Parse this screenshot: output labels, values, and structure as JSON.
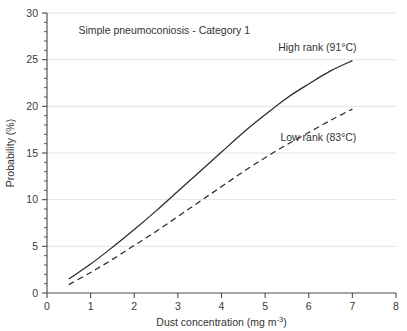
{
  "chart_data": {
    "type": "line",
    "title": "",
    "annotation_title": "Simple pneumoconiosis - Category 1",
    "xlabel_main": "Dust concentration (mg m",
    "xlabel_sup": "-3",
    "xlabel_tail": ")",
    "xlabel_full": "Dust concentration (mg m-3)",
    "ylabel": "Probability (%)",
    "xlim": [
      0,
      8
    ],
    "ylim": [
      0,
      30
    ],
    "xticks": [
      0,
      1,
      2,
      3,
      4,
      5,
      6,
      7,
      8
    ],
    "xtick_labels": [
      "0",
      "1",
      "2",
      "3",
      "4",
      "5",
      "6",
      "7",
      "8"
    ],
    "yticks": [
      0,
      5,
      10,
      15,
      20,
      25,
      30
    ],
    "ytick_labels": [
      "0",
      "5",
      "10",
      "15",
      "20",
      "25",
      "30"
    ],
    "y_minor_ticks": [
      1,
      2,
      3,
      4,
      6,
      7,
      8,
      9,
      11,
      12,
      13,
      14,
      16,
      17,
      18,
      19,
      21,
      22,
      23,
      24,
      26,
      27,
      28,
      29
    ],
    "grid": "horizontal-major",
    "grid_color": "#e3e3e3",
    "axis_color": "#4a4a4a",
    "legend_position": "inline-annotation",
    "series": [
      {
        "name": "High rank (91°C)",
        "label": "High rank (91°C)",
        "style": "solid",
        "color": "#2b2b2b",
        "x": [
          0.5,
          1.0,
          1.5,
          2.0,
          2.5,
          3.0,
          3.5,
          4.0,
          4.5,
          5.0,
          5.5,
          6.0,
          6.5,
          7.0
        ],
        "y": [
          1.5,
          3.1,
          4.9,
          6.8,
          8.8,
          10.9,
          13.0,
          15.1,
          17.2,
          19.1,
          20.9,
          22.4,
          23.8,
          24.9
        ]
      },
      {
        "name": "Low rank (83°C)",
        "label": "Low rank (83°C)",
        "style": "dashed",
        "color": "#2b2b2b",
        "x": [
          0.5,
          1.0,
          1.5,
          2.0,
          2.5,
          3.0,
          3.5,
          4.0,
          4.5,
          5.0,
          5.5,
          6.0,
          6.5,
          7.0
        ],
        "y": [
          0.9,
          2.2,
          3.6,
          5.1,
          6.6,
          8.2,
          9.8,
          11.4,
          13.0,
          14.5,
          15.9,
          17.2,
          18.5,
          19.7
        ]
      }
    ],
    "annotations": [
      {
        "name": "chart-caption",
        "text": "Simple pneumoconiosis - Category 1",
        "x": 0.72,
        "y": 27.7
      },
      {
        "name": "series-label-high-rank",
        "text": "High rank (91°C)",
        "x": 5.3,
        "y": 25.9
      },
      {
        "name": "series-label-low-rank",
        "text": "Low rank (83°C)",
        "x": 5.35,
        "y": 16.3
      }
    ]
  }
}
